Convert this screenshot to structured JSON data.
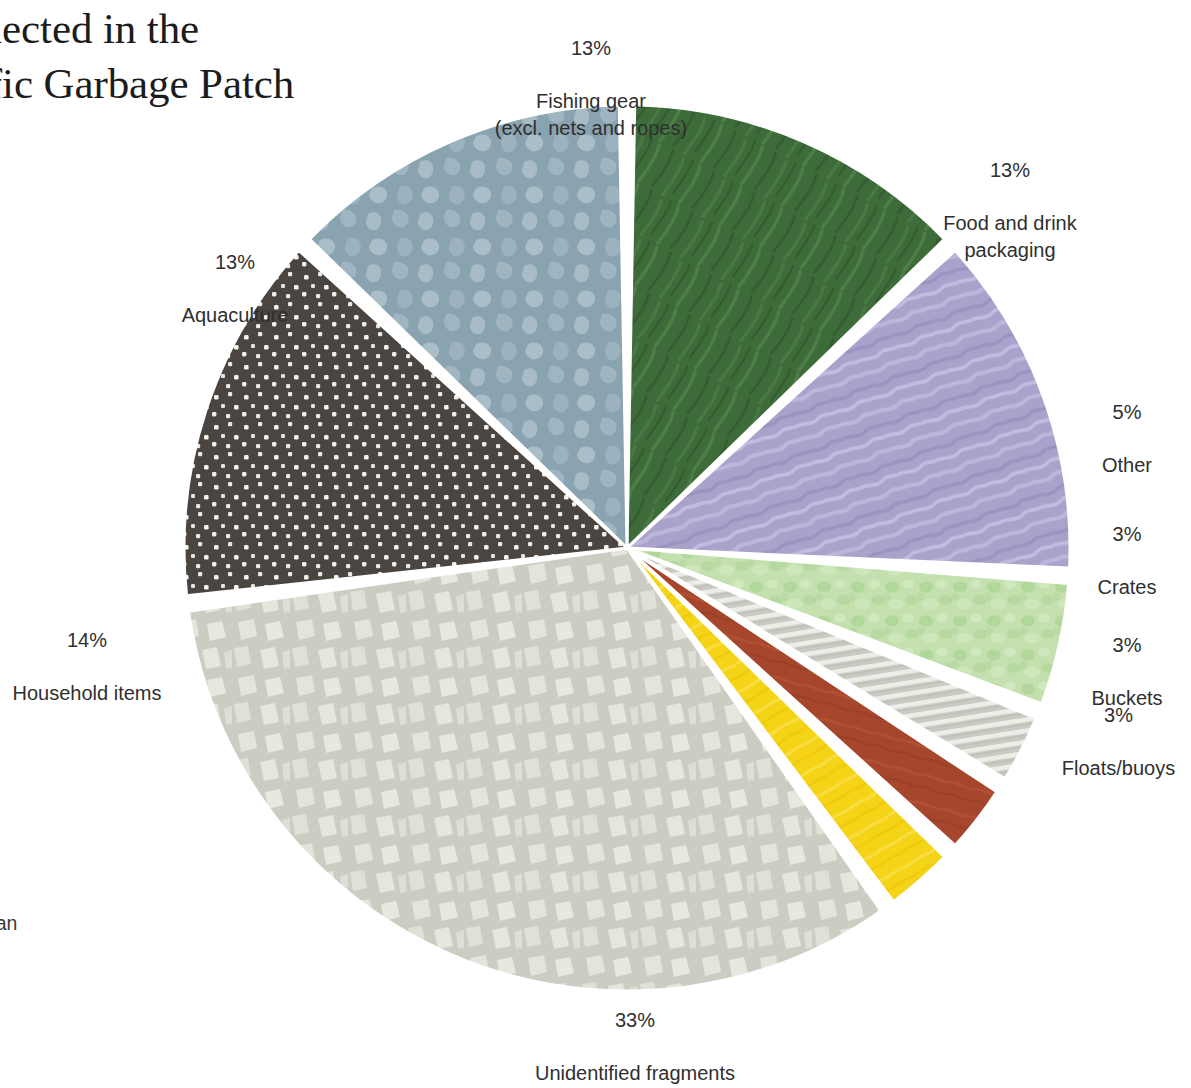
{
  "headline": {
    "text": "collected in the\nacific Garbage Patch",
    "full_visible": "collected in the acific Garbage Patch",
    "clipped": true
  },
  "caption": {
    "line_kicker": "s",
    "text": "s the different\nore than 6,000\nlastic – larger than\nected from the\narbage Patch.",
    "clipped": true
  },
  "chart_data": {
    "type": "pie",
    "title": "collected in the acific Garbage Patch",
    "start_angle_deg": -90,
    "direction": "clockwise",
    "center": {
      "x": 627,
      "y": 548
    },
    "radius": 443,
    "gap_deg": 2.0,
    "units": "percent",
    "categories": [
      "Fishing gear (excl. nets and ropes)",
      "Food and drink packaging",
      "Other",
      "Crates",
      "Buckets",
      "Floats/buoys",
      "Unidentified fragments",
      "Household items",
      "Aquaculture"
    ],
    "values": [
      13,
      13,
      5,
      3,
      3,
      3,
      33,
      14,
      13
    ],
    "labels": [
      "13%",
      "13%",
      "5%",
      "3%",
      "3%",
      "3%",
      "33%",
      "14%",
      "13%"
    ],
    "colors": [
      "#3d6b3a",
      "#a9a3cc",
      "#c3e0ae",
      "#c9cbc3",
      "#a6462c",
      "#f5d417",
      "#ccccc2",
      "#4a4540",
      "#8aa3b0"
    ],
    "slices": [
      {
        "label": "Fishing gear (excl. nets and ropes)",
        "percent_text": "13%",
        "value": 13,
        "color": "#3d6b3a",
        "texture": "brush-strokes"
      },
      {
        "label": "Food and drink packaging",
        "percent_text": "13%",
        "value": 13,
        "color": "#a9a3cc",
        "texture": "wavy-streaks"
      },
      {
        "label": "Other",
        "percent_text": "5%",
        "value": 5,
        "color": "#c3e0ae",
        "texture": "mottled-blobs"
      },
      {
        "label": "Crates",
        "percent_text": "3%",
        "value": 3,
        "color": "#c9cbc3",
        "texture": "horizontal-stripes"
      },
      {
        "label": "Buckets",
        "percent_text": "3%",
        "value": 3,
        "color": "#a6462c",
        "texture": "solid"
      },
      {
        "label": "Floats/buoys",
        "percent_text": "3%",
        "value": 3,
        "color": "#f5d417",
        "texture": "solid"
      },
      {
        "label": "Unidentified fragments",
        "percent_text": "33%",
        "value": 33,
        "color": "#ccccc2",
        "texture": "fragment-shards"
      },
      {
        "label": "Household items",
        "percent_text": "14%",
        "value": 14,
        "color": "#4a4540",
        "texture": "white-dots"
      },
      {
        "label": "Aquaculture",
        "percent_text": "13%",
        "value": 13,
        "color": "#8aa3b0",
        "texture": "camouflage-patches"
      }
    ],
    "legend": "none (direct slice labels)",
    "grid": false,
    "background": "#ffffff"
  },
  "labels": {
    "fishing": {
      "pct": "13%",
      "name": "Fishing gear\n(excl. nets and ropes)"
    },
    "food": {
      "pct": "13%",
      "name": "Food and drink\npackaging"
    },
    "other": {
      "pct": "5%",
      "name": "Other"
    },
    "crates": {
      "pct": "3%",
      "name": "Crates"
    },
    "buckets": {
      "pct": "3%",
      "name": "Buckets"
    },
    "floats": {
      "pct": "3%",
      "name": "Floats/buoys"
    },
    "unid": {
      "pct": "33%",
      "name": "Unidentified fragments"
    },
    "household": {
      "pct": "14%",
      "name": "Household items"
    },
    "aqua": {
      "pct": "13%",
      "name": "Aquaculture"
    }
  }
}
